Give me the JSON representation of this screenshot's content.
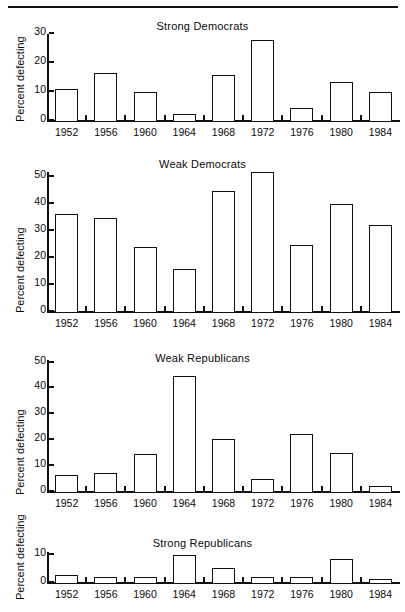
{
  "figure": {
    "has_top_rule": true,
    "background": "#ffffff",
    "ink": "#101010"
  },
  "chart_data": [
    {
      "type": "bar",
      "title": "Strong Democrats",
      "xlabel": "",
      "ylabel": "Percent defecting",
      "categories": [
        "1952",
        "1956",
        "1960",
        "1964",
        "1968",
        "1972",
        "1976",
        "1980",
        "1984"
      ],
      "values": [
        11,
        16.5,
        10,
        2.5,
        16,
        28,
        4.5,
        13.5,
        10
      ],
      "ylim": [
        0,
        30
      ],
      "yticks": [
        0,
        10,
        20,
        30
      ],
      "ytick_labels": [
        "0",
        "10",
        "20",
        "30"
      ],
      "grid": false,
      "legend": "none"
    },
    {
      "type": "bar",
      "title": "Weak Democrats",
      "xlabel": "",
      "ylabel": "Percent defecting",
      "categories": [
        "1952",
        "1956",
        "1960",
        "1964",
        "1968",
        "1972",
        "1976",
        "1980",
        "1984"
      ],
      "values": [
        36.5,
        35,
        24,
        16,
        45,
        52,
        25,
        40,
        32.5
      ],
      "ylim": [
        0,
        52
      ],
      "yticks": [
        0,
        10,
        20,
        30,
        40,
        50
      ],
      "ytick_labels": [
        "0",
        "10",
        "20",
        "30",
        "40",
        "50"
      ],
      "grid": false,
      "legend": "none"
    },
    {
      "type": "bar",
      "title": "Weak Republicans",
      "xlabel": "",
      "ylabel": "Percent defecting",
      "categories": [
        "1952",
        "1956",
        "1960",
        "1964",
        "1968",
        "1972",
        "1976",
        "1980",
        "1984"
      ],
      "values": [
        6.5,
        7.5,
        14.5,
        45,
        20.5,
        5,
        22.5,
        15,
        2.5
      ],
      "ylim": [
        0,
        51
      ],
      "yticks": [
        0,
        10,
        20,
        30,
        40,
        50
      ],
      "ytick_labels": [
        "0",
        "10",
        "20",
        "30",
        "40",
        "50"
      ],
      "grid": false,
      "legend": "none"
    },
    {
      "type": "bar",
      "title": "Strong Republicans",
      "xlabel": "",
      "ylabel": "Percent defecting",
      "categories": [
        "1952",
        "1956",
        "1960",
        "1964",
        "1968",
        "1972",
        "1976",
        "1980",
        "1984"
      ],
      "values": [
        3,
        2,
        2,
        10,
        5.5,
        2,
        2,
        8.5,
        1.5
      ],
      "ylim": [
        0,
        11
      ],
      "yticks": [
        0,
        10
      ],
      "ytick_labels": [
        "0",
        "10"
      ],
      "grid": false,
      "legend": "none"
    }
  ]
}
